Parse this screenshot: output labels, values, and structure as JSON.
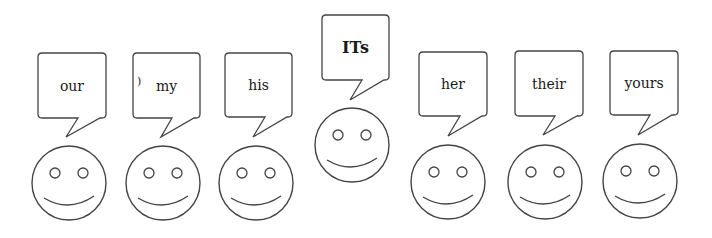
{
  "diagram": {
    "stroke_color": "#444444",
    "figures": [
      {
        "label": "our",
        "bold": false,
        "bubble": {
          "x": 38,
          "y": 53,
          "w": 68,
          "h": 65
        },
        "tail": {
          "bx1": 78,
          "bx2": 100,
          "tipx": 66,
          "tipy": 137
        },
        "face": {
          "cx": 69,
          "cy": 183,
          "r": 37
        },
        "stray_mark": false
      },
      {
        "label": "my",
        "bold": false,
        "bubble": {
          "x": 133,
          "y": 53,
          "w": 67,
          "h": 65
        },
        "tail": {
          "bx1": 172,
          "bx2": 194,
          "tipx": 161,
          "tipy": 137
        },
        "face": {
          "cx": 163,
          "cy": 183,
          "r": 37
        },
        "stray_mark": true
      },
      {
        "label": "his",
        "bold": false,
        "bubble": {
          "x": 225,
          "y": 53,
          "w": 67,
          "h": 64
        },
        "tail": {
          "bx1": 265,
          "bx2": 287,
          "tipx": 253,
          "tipy": 137
        },
        "face": {
          "cx": 256,
          "cy": 183,
          "r": 37
        },
        "stray_mark": false
      },
      {
        "label": "ITs",
        "bold": true,
        "bubble": {
          "x": 322,
          "y": 15,
          "w": 67,
          "h": 65
        },
        "tail": {
          "bx1": 362,
          "bx2": 384,
          "tipx": 350,
          "tipy": 100
        },
        "face": {
          "cx": 352,
          "cy": 145,
          "r": 37
        },
        "stray_mark": false
      },
      {
        "label": "her",
        "bold": false,
        "bubble": {
          "x": 419,
          "y": 52,
          "w": 68,
          "h": 64
        },
        "tail": {
          "bx1": 460,
          "bx2": 482,
          "tipx": 448,
          "tipy": 136
        },
        "face": {
          "cx": 448,
          "cy": 182,
          "r": 37
        },
        "stray_mark": false
      },
      {
        "label": "their",
        "bold": false,
        "bubble": {
          "x": 515,
          "y": 51,
          "w": 68,
          "h": 65
        },
        "tail": {
          "bx1": 555,
          "bx2": 577,
          "tipx": 543,
          "tipy": 135
        },
        "face": {
          "cx": 545,
          "cy": 182,
          "r": 37
        },
        "stray_mark": false
      },
      {
        "label": "yours",
        "bold": false,
        "bubble": {
          "x": 610,
          "y": 51,
          "w": 68,
          "h": 64
        },
        "tail": {
          "bx1": 650,
          "bx2": 672,
          "tipx": 638,
          "tipy": 135
        },
        "face": {
          "cx": 640,
          "cy": 181,
          "r": 37
        },
        "stray_mark": false
      }
    ]
  }
}
